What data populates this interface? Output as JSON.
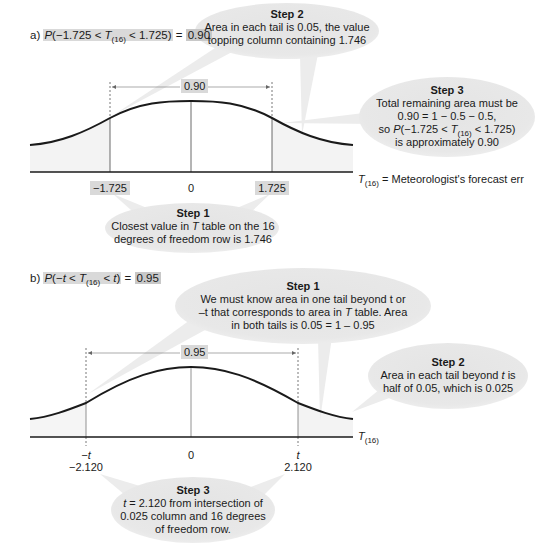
{
  "panel_a": {
    "label": "a)",
    "prob_expr": {
      "P": "P",
      "open": "(−1.725 < ",
      "T": "T",
      "sub": "(16)",
      "close": " < 1.725)"
    },
    "equals": " = ",
    "result": "0.90",
    "span_label": "0.90",
    "ticks": {
      "left": "−1.725",
      "center": "0",
      "right": "1.725"
    },
    "legend": {
      "T": "T",
      "sub": "(16)",
      "text": " = Meteorologist's forecast err"
    },
    "step1": {
      "title": "Step 1",
      "line1_pre": "Closest value in ",
      "line1_T": "T",
      "line1_post": " table on the 16",
      "line2": "degrees of freedom row is 1.746"
    },
    "step2": {
      "title": "Step 2",
      "line1": "Area in each tail is 0.05, the value",
      "line2": "topping column containing 1.746"
    },
    "step3": {
      "title": "Step 3",
      "line1": "Total remaining area must be",
      "line2": "0.90 = 1 − 0.5 − 0.5,",
      "line3_pre": "so ",
      "line3_P": "P",
      "line3_mid": "(−1.725 < ",
      "line3_T": "T",
      "line3_sub": "(16)",
      "line3_post": " < 1.725)",
      "line4": "is approximately 0.90"
    }
  },
  "panel_b": {
    "label": "b)",
    "prob_expr": {
      "P": "P",
      "open": "(−",
      "t1": "t",
      "lt": " < ",
      "T": "T",
      "sub": "(16)",
      "lt2": " < ",
      "t2": "t",
      "close": ")"
    },
    "equals": " = ",
    "result": "0.95",
    "span_label": "0.95",
    "ticks": {
      "left_sym": "−t",
      "left_val": "−2.120",
      "center": "0",
      "right_sym": "t",
      "right_val": "2.120"
    },
    "axis_label": {
      "T": "T",
      "sub": "(16)"
    },
    "step1": {
      "title": "Step 1",
      "line1": "We must know area in one tail beyond t or",
      "line2_pre": "–t that corresponds to area in ",
      "line2_T": "T",
      "line2_post": " table. Area",
      "line3": "in both tails is 0.05 = 1 – 0.95"
    },
    "step2": {
      "title": "Step 2",
      "line1_pre": "Area in each tail beyond ",
      "line1_t": "t",
      "line1_post": " is",
      "line2": "half of 0.05, which is 0.025"
    },
    "step3": {
      "title": "Step 3",
      "line1_t": "t",
      "line1_post": " = 2.120 from intersection of",
      "line2": "0.025 column and 16 degrees",
      "line3": "of freedom row."
    }
  },
  "colors": {
    "bubble": "#e6e6e6",
    "tail_shade": "#f2f2f2",
    "highlight": "#d9d9d9",
    "curve": "#1a1a1a"
  }
}
